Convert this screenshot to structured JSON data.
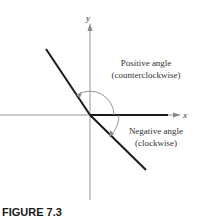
{
  "figure": {
    "caption": "FIGURE 7.3",
    "axes": {
      "x_label": "x",
      "y_label": "y"
    },
    "labels": {
      "positive_line1": "Positive angle",
      "positive_line2": "(counterclockwise)",
      "negative_line1": "Negative angle",
      "negative_line2": "(clockwise)"
    },
    "colors": {
      "axis": "#8a8a8a",
      "ray": "#1a1a1a",
      "arc": "#8a8a8a",
      "text": "#333333"
    }
  }
}
